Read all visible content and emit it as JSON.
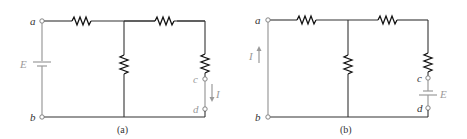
{
  "figure": {
    "panels": [
      {
        "id": "a",
        "caption": "(a)",
        "nodes": {
          "a": "a",
          "b": "b",
          "c": "c",
          "d": "d"
        },
        "source_label": "E",
        "current_label": "I",
        "description": "Voltage source E between a and b; short circuit c-d with current I flowing downward"
      },
      {
        "id": "b",
        "caption": "(b)",
        "nodes": {
          "a": "a",
          "b": "b",
          "c": "c",
          "d": "d"
        },
        "source_label": "E",
        "current_label": "I",
        "description": "Source E moved between c and d; short circuit a-b with current I flowing upward"
      }
    ],
    "colors": {
      "wire": "#333333",
      "highlight": "#9a9a9a",
      "resistor": "#111111"
    }
  }
}
